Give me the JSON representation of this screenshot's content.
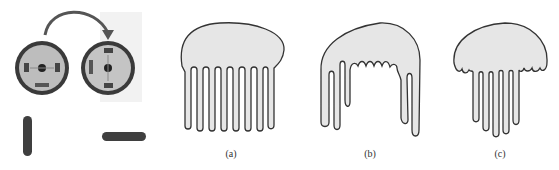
{
  "figure": {
    "photo_panel": {
      "description": "Two rotating discs with an arrow indicating rotation, and two elongated bars (vertical and horizontal)",
      "icons": [
        "rotation-arrow-icon",
        "disc-before",
        "disc-after",
        "vertical-bar",
        "horizontal-bar"
      ]
    },
    "panels": [
      {
        "id": "a",
        "label": "(a)",
        "description": "Dome shape with evenly spaced long straight fingers"
      },
      {
        "id": "b",
        "label": "(b)",
        "description": "Dome shape with irregular fingers, long at the edges and short wavy in the middle"
      },
      {
        "id": "c",
        "label": "(c)",
        "description": "Smaller dome with wavy rim and long fingers in the center"
      }
    ],
    "colors": {
      "fill": "#e6e6e6",
      "stroke": "#333333",
      "disc_dark": "#3a3a3a",
      "disc_light": "#bdbdbd"
    }
  }
}
